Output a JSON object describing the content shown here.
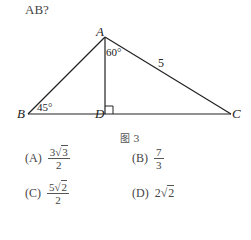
{
  "question": {
    "text": "AB?"
  },
  "figure": {
    "points": {
      "A": {
        "label": "A",
        "x": 105,
        "y": 37
      },
      "B": {
        "label": "B",
        "x": 28,
        "y": 114
      },
      "D": {
        "label": "D",
        "x": 105,
        "y": 114
      },
      "C": {
        "label": "C",
        "x": 231,
        "y": 114
      }
    },
    "angles": {
      "B": "45°",
      "DAC": "60°"
    },
    "sides": {
      "AC": "5"
    },
    "caption": "图 3"
  },
  "options": [
    {
      "key": "(A)",
      "num_coef": "3",
      "num_rad": "3",
      "den": "2"
    },
    {
      "key": "(B)",
      "num": "7",
      "den": "3"
    },
    {
      "key": "(C)",
      "num_coef": "5",
      "num_rad": "2",
      "den": "2"
    },
    {
      "key": "(D)",
      "coef": "2",
      "rad": "2"
    }
  ]
}
